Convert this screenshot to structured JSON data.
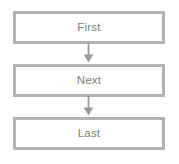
{
  "diagram": {
    "type": "flowchart",
    "orientation": "vertical",
    "title": "",
    "background_color": "#ffffff",
    "node_border_color": "#b3b3b3",
    "node_fill_color": "#ffffff",
    "node_text_color": "#7d7d7d",
    "arrow_color": "#9a9a9a",
    "nodes": [
      {
        "id": "first",
        "label": "First",
        "shape": "rectangle"
      },
      {
        "id": "next",
        "label": "Next",
        "shape": "rectangle"
      },
      {
        "id": "last",
        "label": "Last",
        "shape": "rectangle"
      }
    ],
    "connectors": [
      {
        "id": "c1",
        "from": "first",
        "to": "next",
        "icon": "arrow-down-icon",
        "label": ""
      },
      {
        "id": "c2",
        "from": "next",
        "to": "last",
        "icon": "arrow-down-icon",
        "label": ""
      }
    ]
  }
}
